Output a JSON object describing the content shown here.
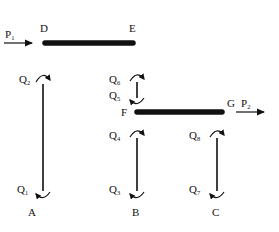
{
  "diagram": {
    "type": "structural-frame",
    "nodes": [
      {
        "id": "D",
        "label": "D"
      },
      {
        "id": "E",
        "label": "E"
      },
      {
        "id": "F",
        "label": "F"
      },
      {
        "id": "G",
        "label": "G"
      },
      {
        "id": "A",
        "label": "A"
      },
      {
        "id": "B",
        "label": "B"
      },
      {
        "id": "C",
        "label": "C"
      }
    ],
    "beams": [
      {
        "id": "DE",
        "from": "D",
        "to": "E"
      },
      {
        "id": "FG",
        "from": "F",
        "to": "G"
      }
    ],
    "columns": [
      {
        "id": "AD",
        "top_moment": "Q2",
        "bottom_moment": "Q1"
      },
      {
        "id": "EF",
        "top_moment": "Q6",
        "bottom_moment": "Q5"
      },
      {
        "id": "FB",
        "top_moment": "Q4",
        "bottom_moment": "Q3"
      },
      {
        "id": "GC",
        "top_moment": "Q8",
        "bottom_moment": "Q7"
      }
    ],
    "loads": [
      {
        "id": "P1",
        "label": "P",
        "sub": "1",
        "direction": "right"
      },
      {
        "id": "P2",
        "label": "P",
        "sub": "2",
        "direction": "right"
      }
    ],
    "moments": [
      {
        "label": "Q",
        "sub": "1"
      },
      {
        "label": "Q",
        "sub": "2"
      },
      {
        "label": "Q",
        "sub": "3"
      },
      {
        "label": "Q",
        "sub": "4"
      },
      {
        "label": "Q",
        "sub": "5"
      },
      {
        "label": "Q",
        "sub": "6"
      },
      {
        "label": "Q",
        "sub": "7"
      },
      {
        "label": "Q",
        "sub": "8"
      }
    ],
    "colors": {
      "ink": "#111111",
      "background": "#ffffff"
    }
  }
}
